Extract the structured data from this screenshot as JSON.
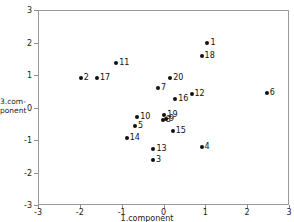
{
  "chart_data": {
    "type": "scatter",
    "title": "",
    "xlabel": "1.component",
    "ylabel": "3.component",
    "ylabel_lines": [
      "3.com-",
      "ponent"
    ],
    "xlim": [
      -3,
      3
    ],
    "ylim": [
      -3,
      3
    ],
    "xticks": [
      -3,
      -2,
      -1,
      0,
      1,
      2,
      3
    ],
    "yticks": [
      -3,
      -2,
      -1,
      0,
      1,
      2,
      3
    ],
    "xticklabels": [
      "-3",
      "-2",
      "-1",
      "0",
      "1",
      "2",
      "3"
    ],
    "yticklabels": [
      "-3",
      "-2",
      "-1",
      "0",
      "1",
      "2",
      "3"
    ],
    "grid": false,
    "legend": false,
    "marker": "filled-circle",
    "marker_color": "#111111",
    "frame_color": "#9a9a9a",
    "points": [
      {
        "label": "1",
        "x": 1.05,
        "y": 1.98
      },
      {
        "label": "2",
        "x": -1.98,
        "y": 0.91
      },
      {
        "label": "3",
        "x": -0.25,
        "y": -1.62
      },
      {
        "label": "4",
        "x": 0.91,
        "y": -1.22
      },
      {
        "label": "5",
        "x": -0.68,
        "y": -0.57
      },
      {
        "label": "6",
        "x": 2.47,
        "y": 0.45
      },
      {
        "label": "7",
        "x": -0.13,
        "y": 0.6
      },
      {
        "label": "8",
        "x": -0.02,
        "y": -0.37
      },
      {
        "label": "9",
        "x": 0.06,
        "y": -0.36
      },
      {
        "label": "10",
        "x": -0.63,
        "y": -0.28
      },
      {
        "label": "11",
        "x": -1.13,
        "y": 1.38
      },
      {
        "label": "12",
        "x": 0.67,
        "y": 0.42
      },
      {
        "label": "13",
        "x": -0.24,
        "y": -1.28
      },
      {
        "label": "14",
        "x": -0.88,
        "y": -0.93
      },
      {
        "label": "15",
        "x": 0.22,
        "y": -0.72
      },
      {
        "label": "16",
        "x": 0.28,
        "y": 0.25
      },
      {
        "label": "17",
        "x": -1.59,
        "y": 0.91
      },
      {
        "label": "18",
        "x": 0.91,
        "y": 1.6
      },
      {
        "label": "19",
        "x": 0.02,
        "y": -0.23
      },
      {
        "label": "20",
        "x": 0.16,
        "y": 0.92
      }
    ]
  }
}
